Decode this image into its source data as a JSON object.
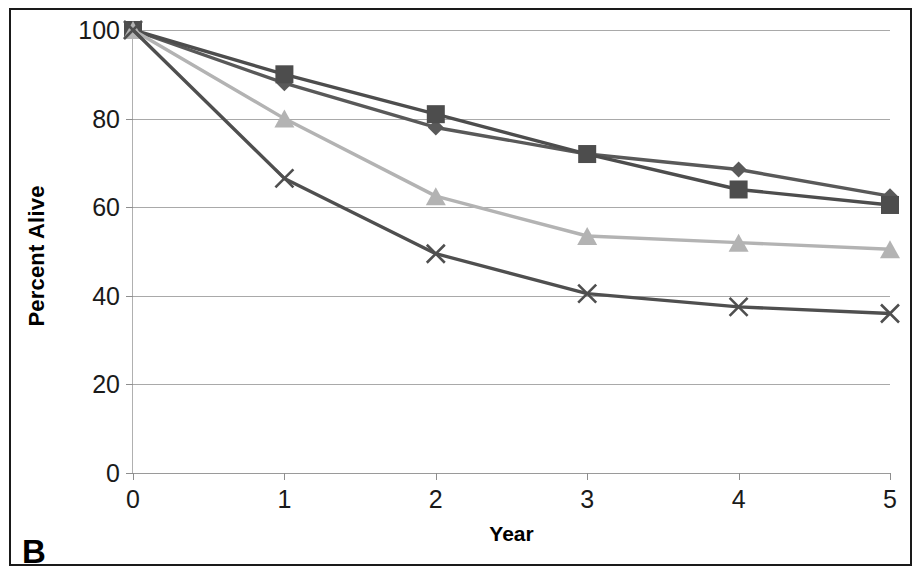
{
  "panel": {
    "label": "B"
  },
  "chart_data": {
    "type": "line",
    "title": "",
    "xlabel": "Year",
    "ylabel": "Percent Alive",
    "x": [
      0,
      1,
      2,
      3,
      4,
      5
    ],
    "xtick_labels": [
      "0",
      "1",
      "2",
      "3",
      "4",
      "5"
    ],
    "ytick_labels": [
      "0",
      "20",
      "40",
      "60",
      "80",
      "100"
    ],
    "yticks": [
      0,
      20,
      40,
      60,
      80,
      100
    ],
    "xlim": [
      0,
      5
    ],
    "ylim": [
      0,
      100
    ],
    "grid": "horizontal",
    "legend": "none",
    "series": [
      {
        "name": "series-diamond",
        "marker": "diamond",
        "color": "#595959",
        "values": [
          100,
          88,
          78,
          72,
          68.5,
          62.5
        ]
      },
      {
        "name": "series-square",
        "marker": "square",
        "color": "#4d4d4d",
        "values": [
          100,
          90,
          81,
          72,
          64,
          60.5
        ]
      },
      {
        "name": "series-triangle",
        "marker": "triangle",
        "color": "#b3b3b3",
        "values": [
          100,
          80,
          62.5,
          53.5,
          52,
          50.5
        ]
      },
      {
        "name": "series-cross",
        "marker": "x",
        "color": "#4f4f4f",
        "values": [
          100,
          66.5,
          49.5,
          40.5,
          37.5,
          36
        ]
      }
    ]
  },
  "colors": {
    "frame": "#1a1a1a",
    "gridline": "#a9a9a9",
    "axis_text": "#1a1a1a",
    "background": "#ffffff"
  }
}
